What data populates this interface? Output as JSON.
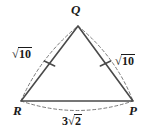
{
  "figure": {
    "type": "geometry-diagram",
    "shape": "triangle",
    "background_color": "#ffffff",
    "stroke_color": "#3c3c3c",
    "text_color": "#1a1a1a",
    "vertices": [
      {
        "name": "Q",
        "label": "Q",
        "x": 78,
        "y": 26,
        "label_x": 71,
        "label_y": 3
      },
      {
        "name": "R",
        "label": "R",
        "x": 21,
        "y": 101,
        "label_x": 13,
        "label_y": 104
      },
      {
        "name": "P",
        "label": "P",
        "x": 133,
        "y": 101,
        "label_x": 129,
        "label_y": 104
      }
    ],
    "sides": [
      {
        "name": "side-rq",
        "from": "R",
        "to": "Q",
        "label_prefix": "",
        "label_root": "10",
        "label_text": "√10",
        "tick_marks": 1,
        "label_x": 12,
        "label_y": 47
      },
      {
        "name": "side-qp",
        "from": "Q",
        "to": "P",
        "label_prefix": "",
        "label_root": "10",
        "label_text": "√10",
        "tick_marks": 1,
        "label_x": 115,
        "label_y": 54
      },
      {
        "name": "side-rp",
        "from": "R",
        "to": "P",
        "label_prefix": "3",
        "label_root": "2",
        "label_text": "3√2",
        "tick_marks": 0,
        "label_x": 62,
        "label_y": 114
      }
    ],
    "radical_sign": "√"
  }
}
